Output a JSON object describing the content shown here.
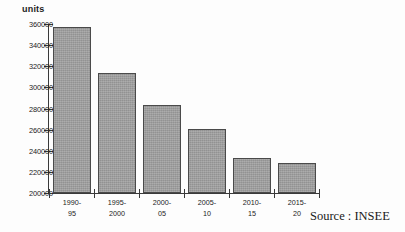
{
  "chart_data": {
    "type": "bar",
    "title": "",
    "subtitle": "",
    "xlabel": "",
    "ylabel": "units",
    "ylim": [
      200000,
      360000
    ],
    "ytick_step": 20000,
    "yticks": [
      360000,
      340000,
      320000,
      300000,
      280000,
      260000,
      240000,
      220000,
      200000
    ],
    "ytick_labels": [
      "360000",
      "340000",
      "320000",
      "300000",
      "280000",
      "260000",
      "240000",
      "220000",
      "200000"
    ],
    "grid": false,
    "legend": null,
    "legend_position": "none",
    "categories": [
      "1990-95",
      "1995-2000",
      "2000-05",
      "2005-10",
      "2010-15",
      "2015-20"
    ],
    "category_lines": [
      [
        "1990-",
        "95"
      ],
      [
        "1995-",
        "2000"
      ],
      [
        "2000-",
        "05"
      ],
      [
        "2005-",
        "10"
      ],
      [
        "2010-",
        "15"
      ],
      [
        "2015-",
        "20"
      ]
    ],
    "values": [
      357000,
      313500,
      283000,
      260500,
      233000,
      228500
    ],
    "bar_color": "#9c9c9c",
    "bar_border_color": "#4a4a4a",
    "axis_color": "#3a3a3a"
  },
  "annotations": {
    "units_label": "units",
    "source": "Source : INSEE"
  }
}
